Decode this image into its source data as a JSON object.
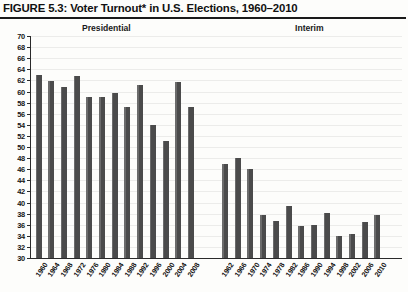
{
  "figure": {
    "title": "FIGURE 5.3: Voter Turnout* in U.S. Elections, 1960–2010"
  },
  "sections": {
    "presidential_label": "Presidential",
    "interim_label": "Interim"
  },
  "axis": {
    "y_ticks": [
      70,
      68,
      66,
      64,
      62,
      60,
      58,
      56,
      54,
      52,
      50,
      48,
      46,
      44,
      42,
      40,
      38,
      36,
      34,
      32,
      30
    ],
    "y_min": 30,
    "y_max": 70,
    "y_step": 2
  },
  "colors": {
    "bar": "#4b4b4b",
    "axis": "#2a2a2a",
    "grid": "#ececea",
    "background": "#fdfdfb",
    "text": "#141414"
  },
  "chart_data": {
    "type": "bar",
    "title": "FIGURE 5.3: Voter Turnout* in U.S. Elections, 1960–2010",
    "xlabel": "",
    "ylabel": "",
    "ylim": [
      30,
      70
    ],
    "grid": true,
    "legend": "none",
    "series": [
      {
        "name": "Presidential",
        "categories": [
          "1960",
          "1964",
          "1968",
          "1972",
          "1976",
          "1980",
          "1984",
          "1988",
          "1992",
          "1996",
          "2000",
          "2004",
          "2008"
        ],
        "values": [
          63.0,
          61.9,
          60.8,
          62.8,
          59.0,
          59.0,
          59.8,
          57.2,
          61.1,
          54.0,
          51.0,
          61.8,
          57.2
        ]
      },
      {
        "name": "Interim",
        "categories": [
          "1962",
          "1966",
          "1970",
          "1974",
          "1978",
          "1982",
          "1986",
          "1990",
          "1994",
          "1998",
          "2002",
          "2006",
          "2010"
        ],
        "values": [
          46.9,
          48.0,
          46.1,
          37.8,
          36.7,
          39.3,
          35.7,
          35.9,
          38.1,
          34.0,
          34.4,
          36.5,
          37.7
        ]
      }
    ]
  }
}
